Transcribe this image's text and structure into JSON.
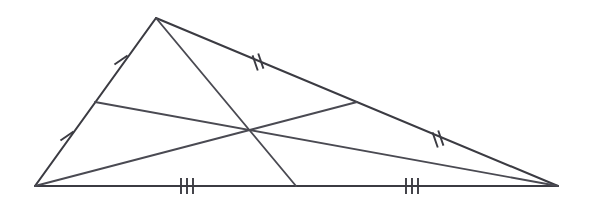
{
  "figure": {
    "type": "geometry-diagram",
    "background_color": "#ffffff",
    "stroke_color": "#3b3b42",
    "median_stroke_color": "#4a4a52",
    "canvas": {
      "width": 594,
      "height": 208
    }
  },
  "vertices": {
    "apex": {
      "label": "top-vertex",
      "x": 156,
      "y": 18
    },
    "left": {
      "label": "left-vertex",
      "x": 35,
      "y": 186
    },
    "right": {
      "label": "right-vertex",
      "x": 558,
      "y": 186
    }
  },
  "midpoints": {
    "left_side": {
      "label": "midpoint-left-side",
      "x": 95,
      "y": 102
    },
    "right_side": {
      "label": "midpoint-right-side",
      "x": 357,
      "y": 102
    },
    "base": {
      "label": "midpoint-base",
      "x": 296,
      "y": 186
    }
  },
  "centroid": {
    "label": "centroid",
    "x": 252,
    "y": 132
  },
  "sides": [
    {
      "name": "left-side",
      "from": "left",
      "to": "apex",
      "tick_count": 1
    },
    {
      "name": "right-side",
      "from": "apex",
      "to": "right",
      "tick_count": 2
    },
    {
      "name": "base-side",
      "from": "left",
      "to": "right",
      "tick_count": 3
    }
  ],
  "medians": [
    {
      "name": "median-from-apex",
      "from": "apex",
      "to": "midpoint-base"
    },
    {
      "name": "median-from-left",
      "from": "left",
      "to": "midpoint-right-side"
    },
    {
      "name": "median-from-right",
      "from": "right",
      "to": "midpoint-left-side"
    }
  ],
  "tick_groups": [
    {
      "name": "tick-upper-left",
      "count": 1,
      "x": 121,
      "y": 60,
      "angle": 55
    },
    {
      "name": "tick-lower-left",
      "count": 1,
      "x": 67,
      "y": 136,
      "angle": 55
    },
    {
      "name": "tick-upper-right",
      "count": 2,
      "x": 258,
      "y": 62,
      "angle": -19
    },
    {
      "name": "tick-lower-right",
      "count": 2,
      "x": 438,
      "y": 139,
      "angle": -19
    },
    {
      "name": "tick-base-left",
      "count": 3,
      "x": 187,
      "y": 186,
      "angle": 0
    },
    {
      "name": "tick-base-right",
      "count": 3,
      "x": 412,
      "y": 186,
      "angle": 0
    }
  ]
}
